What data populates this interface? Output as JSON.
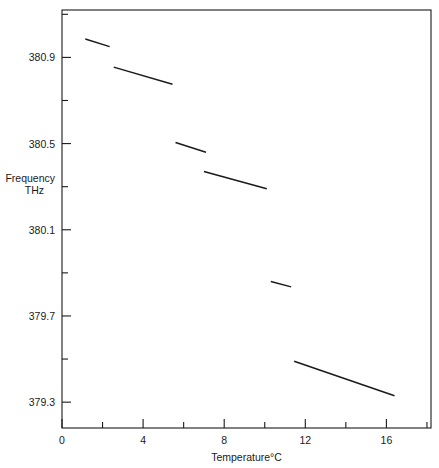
{
  "chart_data": {
    "type": "line",
    "title": "",
    "xlabel": "Temperature°C",
    "ylabel_line1": "Frequency",
    "ylabel_line2": "THz",
    "xlim": [
      0,
      18.2
    ],
    "ylim": [
      379.18,
      381.12
    ],
    "grid": false,
    "legend": "none",
    "xticks_major": [
      0,
      4,
      8,
      12,
      16
    ],
    "xticklabels": [
      "0",
      "4",
      "8",
      "12",
      "16"
    ],
    "xticks_minor": [
      2,
      6,
      10,
      14,
      18
    ],
    "yticks_major": [
      380.9,
      380.5,
      380.1,
      379.7,
      379.3
    ],
    "yticklabels": [
      "380.9",
      "380.5",
      "380.1",
      "379.7",
      "379.3"
    ],
    "yticks_minor": [
      381.1,
      380.7,
      380.3,
      379.9,
      379.5
    ],
    "series": [
      {
        "name": "mode-segment-1",
        "segments": [
          {
            "x": [
              1.15,
              2.35
            ],
            "y": [
              380.985,
              380.95
            ]
          },
          {
            "x": [
              2.55,
              5.45
            ],
            "y": [
              380.855,
              380.775
            ]
          },
          {
            "x": [
              5.6,
              7.1
            ],
            "y": [
              380.505,
              380.46
            ]
          },
          {
            "x": [
              7.0,
              10.1
            ],
            "y": [
              380.37,
              380.29
            ]
          },
          {
            "x": [
              10.3,
              11.3
            ],
            "y": [
              379.86,
              379.835
            ]
          },
          {
            "x": [
              11.45,
              16.4
            ],
            "y": [
              379.49,
              379.33
            ]
          }
        ]
      }
    ],
    "axis_color": "#1a1a1a",
    "line_color": "#1a1a1a",
    "background": "#ffffff"
  },
  "plot_geometry": {
    "left_px": 62,
    "right_px": 431,
    "top_px": 10,
    "bottom_px": 428
  }
}
